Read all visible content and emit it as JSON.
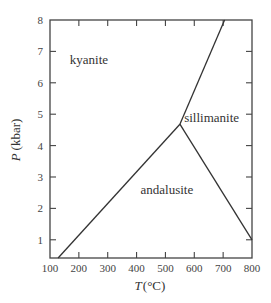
{
  "chart_data": {
    "type": "line",
    "title": "",
    "xlabel": "T (°C)",
    "ylabel": "P (kbar)",
    "xlabel_var": "T",
    "xlabel_unit": "(°C)",
    "ylabel_var": "P",
    "ylabel_unit": "(kbar)",
    "xlim": [
      100,
      800
    ],
    "ylim": [
      0.42,
      8
    ],
    "xticks": [
      100,
      200,
      300,
      400,
      500,
      600,
      700,
      800
    ],
    "yticks": [
      1,
      2,
      3,
      4,
      5,
      6,
      7,
      8
    ],
    "grid": false,
    "legend": null,
    "series": [
      {
        "name": "kyanite–andalusite boundary",
        "points": [
          [
            128,
            0.42
          ],
          [
            550,
            4.68
          ]
        ]
      },
      {
        "name": "kyanite–sillimanite boundary",
        "points": [
          [
            550,
            4.68
          ],
          [
            705,
            8.0
          ]
        ]
      },
      {
        "name": "andalusite–sillimanite boundary",
        "points": [
          [
            550,
            4.68
          ],
          [
            800,
            1.0
          ]
        ]
      }
    ],
    "triple_point": {
      "T": 550,
      "P": 4.68
    },
    "annotations": [
      {
        "text": "kyanite",
        "T": 235,
        "P": 6.6
      },
      {
        "text": "sillimanite",
        "T": 660,
        "P": 4.75
      },
      {
        "text": "andalusite",
        "T": 505,
        "P": 2.45
      }
    ]
  },
  "labels": {
    "kyanite": "kyanite",
    "sillimanite": "sillimanite",
    "andalusite": "andalusite",
    "x_var": "T",
    "x_unit": "(°C)",
    "y_var": "P",
    "y_unit": "(kbar)"
  }
}
